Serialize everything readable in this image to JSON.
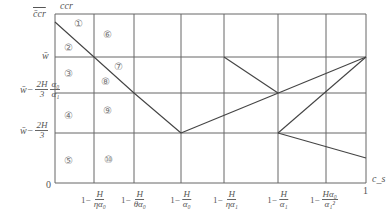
{
  "diagram": {
    "axes": {
      "y_axis_label": "ccr",
      "y_top_label": "c̄cr",
      "x_axis_label": "c_s",
      "origin_label": "0",
      "x_end_label": "1"
    },
    "y_ticks": [
      {
        "id": "w",
        "text": "w̄"
      },
      {
        "id": "w-2H3-a0a1",
        "prefix": "w̄−",
        "frac1_top": "2H",
        "frac1_bot": "3",
        "frac2_top": "α₀",
        "frac2_bot": "α₁"
      },
      {
        "id": "w-2H3",
        "prefix": "w̄−",
        "frac1_top": "2H",
        "frac1_bot": "3"
      }
    ],
    "x_ticks": [
      {
        "prefix": "1−",
        "top": "H",
        "bot": "ηα₀"
      },
      {
        "prefix": "1−",
        "top": "H",
        "bot": "θα₀"
      },
      {
        "prefix": "1−",
        "top": "H",
        "bot": "α₀"
      },
      {
        "prefix": "1−",
        "top": "H",
        "bot": "ηα₁"
      },
      {
        "prefix": "1−",
        "top": "H",
        "bot": "α₁"
      },
      {
        "prefix": "1−",
        "top": "Hα₀",
        "bot": "α₁²"
      }
    ],
    "regions": [
      "①",
      "②",
      "③",
      "④",
      "⑤",
      "⑥",
      "⑦",
      "⑧",
      "⑨",
      "⑩"
    ],
    "colors": {
      "line": "#555555",
      "grid": "#666666",
      "text": "#555555"
    }
  }
}
